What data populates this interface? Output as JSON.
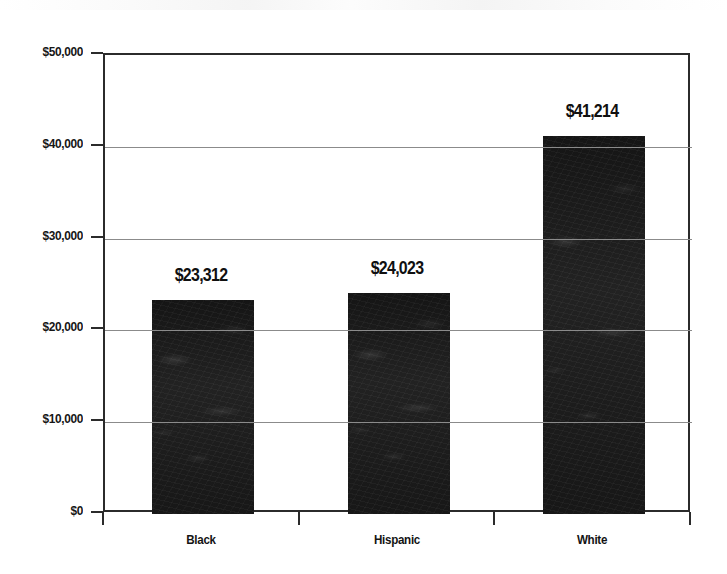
{
  "chart_data": {
    "type": "bar",
    "title": "",
    "subtitle": "",
    "xlabel": "",
    "ylabel": "",
    "categories": [
      "Black",
      "Hispanic",
      "White"
    ],
    "values": [
      23312,
      24023,
      41214
    ],
    "data_labels": [
      "$23,312",
      "$24,023",
      "$41,214"
    ],
    "ylim": [
      0,
      50000
    ],
    "ytick_values": [
      0,
      10000,
      20000,
      30000,
      40000,
      50000
    ],
    "ytick_labels": [
      "$0",
      "$10,000",
      "$20,000",
      "$30,000",
      "$40,000",
      "$50,000"
    ],
    "grid": true,
    "grid_axis": "y",
    "legend": false,
    "legend_position": "none",
    "bar_color": "#1d1d1d",
    "grid_color": "#8b8b8b",
    "axis_color": "#2b2b2b",
    "background_color": "#ffffff",
    "series": [
      {
        "name": "Median Income",
        "values": [
          23312,
          24023,
          41214
        ]
      }
    ],
    "points": [
      {
        "category": "Black",
        "value": 23312,
        "label": "$23,312"
      },
      {
        "category": "Hispanic",
        "value": 24023,
        "label": "$24,023"
      },
      {
        "category": "White",
        "value": 41214,
        "label": "$41,214"
      }
    ]
  }
}
